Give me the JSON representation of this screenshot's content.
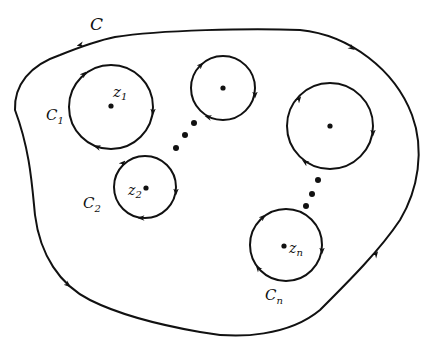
{
  "diagram": {
    "outer_contour": {
      "label": "C"
    },
    "circles": [
      {
        "label": "C",
        "label_sub": "1",
        "point": "z",
        "point_sub": "1"
      },
      {
        "label": "C",
        "label_sub": "2",
        "point": "z",
        "point_sub": "2"
      },
      {
        "label": "",
        "label_sub": "",
        "point": "",
        "point_sub": ""
      },
      {
        "label": "",
        "label_sub": "",
        "point": "",
        "point_sub": ""
      },
      {
        "label": "C",
        "label_sub": "n",
        "point": "z",
        "point_sub": "n"
      }
    ],
    "ellipsis_marks": 2,
    "colors": {
      "stroke": "#111111",
      "background": "#ffffff"
    }
  }
}
